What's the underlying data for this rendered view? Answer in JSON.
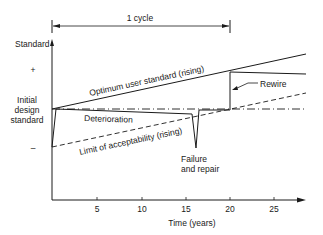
{
  "diagram": {
    "cycle_label": "1 cycle",
    "y_axis_label": "Standard",
    "plus_label": "+",
    "minus_label": "–",
    "initial_label_lines": [
      "Initial",
      "design",
      "standard"
    ],
    "optimum_label": "Optimum user standard (rising)",
    "deterioration_label": "Deterioration",
    "limit_label": "Limit of acceptability (rising)",
    "rewire_label": "Rewire",
    "failure_label_lines": [
      "Failure",
      "and repair"
    ],
    "x_axis_label": "Time (years)",
    "x_ticks": [
      "5",
      "10",
      "15",
      "20",
      "25"
    ]
  }
}
